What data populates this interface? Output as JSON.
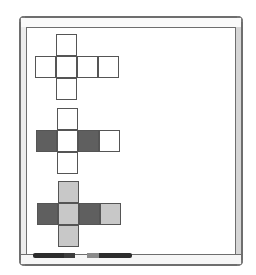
{
  "scene": {
    "description": "Whiteboard showing three cube nets",
    "colors": {
      "outline": "#555555",
      "empty": "#ffffff",
      "dark": "#5f5f5f",
      "light": "#c8c8c8",
      "frame": "#6e6e6e"
    }
  },
  "nets": [
    {
      "name": "blank-net",
      "origin": [
        35,
        34
      ],
      "cells": [
        {
          "col": 1,
          "row": 0,
          "fill": "empty"
        },
        {
          "col": 0,
          "row": 1,
          "fill": "empty"
        },
        {
          "col": 1,
          "row": 1,
          "fill": "empty"
        },
        {
          "col": 2,
          "row": 1,
          "fill": "empty"
        },
        {
          "col": 3,
          "row": 1,
          "fill": "empty"
        },
        {
          "col": 1,
          "row": 2,
          "fill": "empty"
        }
      ]
    },
    {
      "name": "partly-shaded-net",
      "origin": [
        36,
        108
      ],
      "cells": [
        {
          "col": 1,
          "row": 0,
          "fill": "empty"
        },
        {
          "col": 0,
          "row": 1,
          "fill": "dark"
        },
        {
          "col": 1,
          "row": 1,
          "fill": "empty"
        },
        {
          "col": 2,
          "row": 1,
          "fill": "dark"
        },
        {
          "col": 3,
          "row": 1,
          "fill": "empty"
        },
        {
          "col": 1,
          "row": 2,
          "fill": "empty"
        }
      ]
    },
    {
      "name": "fully-shaded-net",
      "origin": [
        37,
        181
      ],
      "cells": [
        {
          "col": 1,
          "row": 0,
          "fill": "light"
        },
        {
          "col": 0,
          "row": 1,
          "fill": "dark"
        },
        {
          "col": 1,
          "row": 1,
          "fill": "light"
        },
        {
          "col": 2,
          "row": 1,
          "fill": "dark"
        },
        {
          "col": 3,
          "row": 1,
          "fill": "light"
        },
        {
          "col": 1,
          "row": 2,
          "fill": "light"
        }
      ]
    }
  ],
  "markers": [
    {
      "name": "marker-left",
      "x": 33,
      "width": 42,
      "cap_x": 64,
      "cap_width": 11,
      "cap_color": "#3d3d3d"
    },
    {
      "name": "marker-right",
      "x": 87,
      "width": 45,
      "cap_x": 87,
      "cap_width": 12,
      "cap_color": "#8a8a8a"
    }
  ]
}
